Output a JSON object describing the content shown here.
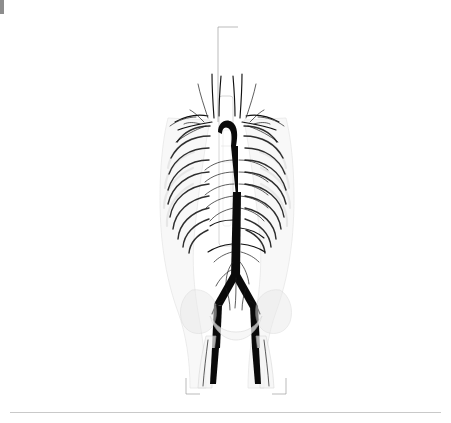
{
  "figure": {
    "bottom_label": "femur bones",
    "text_color": "#2b2b2b",
    "leader_color": "#9a9a9a",
    "background": "#ffffff"
  },
  "labels_left": [
    {
      "text": "right common carotid artery",
      "x": 148,
      "y": 30,
      "tx": 209,
      "ty": 122
    },
    {
      "text": "thyrocervical trunk",
      "x": 148,
      "y": 47,
      "tx": 206,
      "ty": 118
    },
    {
      "text": "costocervical trunk",
      "x": 148,
      "y": 64,
      "tx": 200,
      "ty": 115
    },
    {
      "text": "dorsal scapular artery",
      "x": 148,
      "y": 80,
      "tx": 196,
      "ty": 114
    },
    {
      "text": "suprascapular artery",
      "x": 148,
      "y": 96,
      "tx": 190,
      "ty": 118
    },
    {
      "text": "transverse cervical artery",
      "x": 148,
      "y": 112,
      "tx": 185,
      "ty": 121
    },
    {
      "text": "axillary artery",
      "x": 148,
      "y": 127,
      "tx": 176,
      "ty": 127
    },
    {
      "text": "subscapular artery",
      "x": 148,
      "y": 142,
      "tx": 172,
      "ty": 137
    },
    {
      "text": "ascending aorta",
      "x": 148,
      "y": 158,
      "tx": 207,
      "ty": 150
    },
    {
      "text": "inferior thoracic artery",
      "x": 148,
      "y": 174,
      "tx": 178,
      "ty": 165
    },
    {
      "text": "9th posterior intercostal\nartery",
      "x": 148,
      "y": 194,
      "tx": 182,
      "ty": 186
    },
    {
      "text": "7th anterior intercostal\nartery",
      "x": 148,
      "y": 222,
      "tx": 190,
      "ty": 204
    },
    {
      "text": "superior epigastric artery",
      "x": 148,
      "y": 243,
      "tx": 196,
      "ty": 228
    },
    {
      "text": "musculophrenic artery",
      "x": 148,
      "y": 259,
      "tx": 186,
      "ty": 236
    },
    {
      "text": "right renal artery",
      "x": 148,
      "y": 276,
      "tx": 212,
      "ty": 246
    },
    {
      "text": "subcostal artery",
      "x": 148,
      "y": 293,
      "tx": 210,
      "ty": 252
    },
    {
      "text": "iliolumbar artery",
      "x": 148,
      "y": 309,
      "tx": 213,
      "ty": 272
    },
    {
      "text": "middle sacral artery",
      "x": 148,
      "y": 325,
      "tx": 218,
      "ty": 285
    },
    {
      "text": "inferior epigastric artery",
      "x": 148,
      "y": 342,
      "tx": 208,
      "ty": 293
    },
    {
      "text": "deep circumflex iliac artery",
      "x": 148,
      "y": 363,
      "tx": 204,
      "ty": 300
    }
  ],
  "labels_right": [
    {
      "text": "ascending cervical artery",
      "x": 332,
      "y": 38,
      "tx": 247,
      "ty": 118
    },
    {
      "text": "inferior thyroid artery",
      "x": 332,
      "y": 54,
      "tx": 248,
      "ty": 120
    },
    {
      "text": "vertebral artery",
      "x": 332,
      "y": 70,
      "tx": 244,
      "ty": 117
    },
    {
      "text": "transverse cervical artery",
      "x": 332,
      "y": 85,
      "tx": 256,
      "ty": 121
    },
    {
      "text": "left subclavian artery",
      "x": 332,
      "y": 101,
      "tx": 260,
      "ty": 126
    },
    {
      "text": "thoracoacromial artery",
      "x": 332,
      "y": 117,
      "tx": 268,
      "ty": 131
    },
    {
      "text": "arch of aorta",
      "x": 332,
      "y": 132,
      "tx": 240,
      "ty": 133
    },
    {
      "text": "sternal angle",
      "x": 332,
      "y": 148,
      "tx": 236,
      "ty": 146
    },
    {
      "text": "sternum",
      "x": 332,
      "y": 164,
      "tx": 234,
      "ty": 162
    },
    {
      "text": "thoracic aorta",
      "x": 332,
      "y": 180,
      "tx": 240,
      "ty": 180
    },
    {
      "text": "rib cage",
      "x": 332,
      "y": 196,
      "tx": 286,
      "ty": 196
    },
    {
      "text": "coeliac trunk",
      "x": 332,
      "y": 212,
      "tx": 238,
      "ty": 220
    },
    {
      "text": "superior mesenteric artery",
      "x": 332,
      "y": 228,
      "tx": 240,
      "ty": 228
    },
    {
      "text": "left renal artery",
      "x": 332,
      "y": 244,
      "tx": 244,
      "ty": 244
    },
    {
      "text": "2nd lumbar artery",
      "x": 332,
      "y": 260,
      "tx": 248,
      "ty": 252
    },
    {
      "text": "left testicular artery",
      "x": 332,
      "y": 276,
      "tx": 246,
      "ty": 262
    },
    {
      "text": "inferior mesenteric artery",
      "x": 332,
      "y": 292,
      "tx": 244,
      "ty": 270
    },
    {
      "text": "abdominal aorta",
      "x": 332,
      "y": 308,
      "tx": 238,
      "ty": 276
    },
    {
      "text": "common iliac artery",
      "x": 332,
      "y": 324,
      "tx": 252,
      "ty": 286
    },
    {
      "text": "internal iliac artery",
      "x": 332,
      "y": 340,
      "tx": 250,
      "ty": 296
    },
    {
      "text": "external iliac artery",
      "x": 332,
      "y": 356,
      "tx": 256,
      "ty": 300
    },
    {
      "text": "pelvic bones",
      "x": 332,
      "y": 372,
      "tx": 272,
      "ty": 312
    },
    {
      "text": "femoral artery",
      "x": 332,
      "y": 388,
      "tx": 262,
      "ty": 330
    }
  ],
  "label_top": {
    "text": "brachiocephalic artery",
    "x": 243,
    "y": 27
  }
}
